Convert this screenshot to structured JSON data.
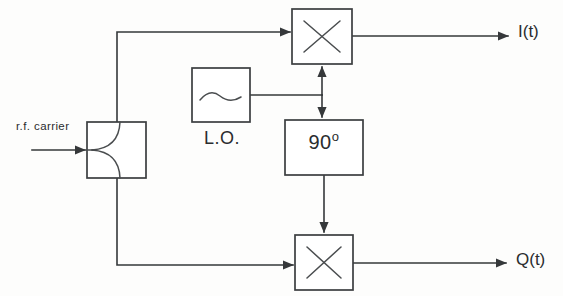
{
  "diagram": {
    "type": "block-diagram",
    "background_color": "#fdfdfc",
    "line_color": "#35383a",
    "labels": {
      "input_signal": "r.f. carrier",
      "local_oscillator": "L.O.",
      "phase_shift_value": "90",
      "phase_shift_degree_symbol": "o",
      "output_inphase": "I(t)",
      "output_quadrature": "Q(t)"
    },
    "blocks": [
      {
        "id": "power-splitter",
        "name": "power-splitter",
        "label": "",
        "glyph": "splitter-curve",
        "x": 87,
        "y": 122,
        "width": 59,
        "height": 56
      },
      {
        "id": "local-oscillator",
        "name": "local-oscillator",
        "label": "L.O.",
        "glyph": "sine-wave",
        "x": 192,
        "y": 68,
        "width": 58,
        "height": 54
      },
      {
        "id": "mixer-i",
        "name": "mixer-inphase",
        "label": "",
        "glyph": "multiply-x",
        "x": 292,
        "y": 9,
        "width": 60,
        "height": 55
      },
      {
        "id": "phase-shifter",
        "name": "phase-shifter-90",
        "label": "90o",
        "glyph": "text",
        "x": 285,
        "y": 120,
        "width": 78,
        "height": 55
      },
      {
        "id": "mixer-q",
        "name": "mixer-quadrature",
        "label": "",
        "glyph": "multiply-x",
        "x": 295,
        "y": 235,
        "width": 58,
        "height": 55
      }
    ],
    "connections": [
      {
        "name": "rf-input-to-splitter",
        "from": "input",
        "to": "power-splitter",
        "arrow": true
      },
      {
        "name": "splitter-to-mixer-i",
        "from": "power-splitter",
        "to": "mixer-i",
        "arrow": true
      },
      {
        "name": "splitter-to-mixer-q",
        "from": "power-splitter",
        "to": "mixer-q",
        "arrow": true
      },
      {
        "name": "lo-to-junction",
        "from": "local-oscillator",
        "to": "lo-junction",
        "arrow": false
      },
      {
        "name": "junction-to-mixer-i",
        "from": "lo-junction",
        "to": "mixer-i",
        "arrow": true
      },
      {
        "name": "junction-to-phase-shifter",
        "from": "lo-junction",
        "to": "phase-shifter",
        "arrow": true
      },
      {
        "name": "phase-shifter-to-mixer-q",
        "from": "phase-shifter",
        "to": "mixer-q",
        "arrow": true
      },
      {
        "name": "mixer-i-to-output",
        "from": "mixer-i",
        "to": "I(t)",
        "arrow": true
      },
      {
        "name": "mixer-q-to-output",
        "from": "mixer-q",
        "to": "Q(t)",
        "arrow": true
      }
    ]
  }
}
